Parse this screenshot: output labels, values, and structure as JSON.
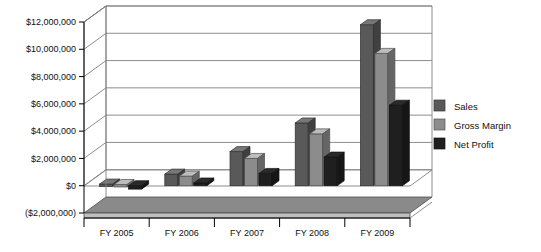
{
  "chart_data": {
    "type": "bar",
    "title": "",
    "xlabel": "",
    "ylabel": "",
    "categories": [
      "FY 2005",
      "FY 2006",
      "FY 2007",
      "FY 2008",
      "FY 2009"
    ],
    "series": [
      {
        "name": "Sales",
        "color": "#595959",
        "values": [
          120000,
          850000,
          2500000,
          4600000,
          11800000
        ]
      },
      {
        "name": "Gross Margin",
        "color": "#8c8c8c",
        "values": [
          90000,
          700000,
          2000000,
          3800000,
          9700000
        ]
      },
      {
        "name": "Net Profit",
        "color": "#1f1f1f",
        "values": [
          -250000,
          200000,
          900000,
          2100000,
          5900000
        ]
      }
    ],
    "ylim": [
      -2000000,
      12000000
    ],
    "ytick_labels": [
      "$12,000,000",
      "$10,000,000",
      "$8,000,000",
      "$6,000,000",
      "$4,000,000",
      "$2,000,000",
      "$0",
      "($2,000,000)"
    ],
    "ytick_values": [
      12000000,
      10000000,
      8000000,
      6000000,
      4000000,
      2000000,
      0,
      -2000000
    ],
    "grid": true,
    "legend_position": "right",
    "style": "3d-columns"
  },
  "legend": {
    "items": [
      {
        "label": "Sales",
        "color": "#595959"
      },
      {
        "label": "Gross Margin",
        "color": "#8c8c8c"
      },
      {
        "label": "Net Profit",
        "color": "#1f1f1f"
      }
    ]
  },
  "colors": {
    "axis": "#000000",
    "grid": "#808080",
    "wall": "#ffffff",
    "floor": "#8a8a8a",
    "plot_background": "#ffffff"
  }
}
